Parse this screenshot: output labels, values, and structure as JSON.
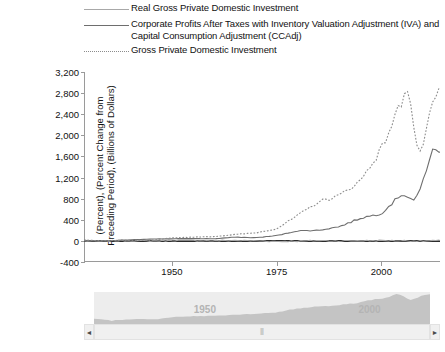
{
  "chart_data": {
    "type": "line",
    "title": "",
    "xlabel": "",
    "ylabel": "(Percent), (Percent Change from Preceding Period), (Billions of Dollars)",
    "ylabel_line1": "(Percent), (Percent Change from",
    "ylabel_line2": "Preceding Period), (Billions of Dollars)",
    "xlim": [
      1929,
      2014
    ],
    "ylim": [
      -400,
      3200
    ],
    "yticks": [
      -400,
      0,
      400,
      800,
      1200,
      1600,
      2000,
      2400,
      2800,
      3200
    ],
    "ytick_labels": [
      "-400",
      "0",
      "400",
      "800",
      "1,200",
      "1,600",
      "2,000",
      "2,400",
      "2,800",
      "3,200"
    ],
    "xticks": [
      1950,
      1975,
      2000
    ],
    "xtick_labels": [
      "1950",
      "1975",
      "2000"
    ],
    "grid": false,
    "legend_position": "top",
    "zero_line": true,
    "series": [
      {
        "name": "Real Gross Private Domestic Investment",
        "style": "solid",
        "color": "#a8a8a8",
        "x": [
          1929,
          1933,
          1937,
          1940,
          1945,
          1950,
          1955,
          1960,
          1965,
          1970,
          1975,
          1980,
          1985,
          1990,
          1995,
          2000,
          2005,
          2010,
          2014
        ],
        "values": [
          2,
          -8,
          5,
          4,
          -3,
          10,
          6,
          3,
          8,
          2,
          -10,
          -5,
          7,
          -2,
          5,
          6,
          4,
          -4,
          5
        ]
      },
      {
        "name": "Corporate Profits After Taxes with Inventory Valuation Adjustment (IVA) and Capital Consumption Adjustment (CCAdj)",
        "style": "solid",
        "color": "#6e6e6e",
        "x": [
          1929,
          1933,
          1940,
          1945,
          1950,
          1955,
          1960,
          1965,
          1970,
          1975,
          1980,
          1985,
          1990,
          1995,
          2000,
          2005,
          2008,
          2009,
          2012,
          2014
        ],
        "values": [
          10,
          -2,
          20,
          35,
          40,
          45,
          40,
          70,
          60,
          100,
          190,
          200,
          270,
          430,
          520,
          900,
          760,
          900,
          1700,
          1680
        ]
      },
      {
        "name": "Gross Private Domestic Investment",
        "style": "dotted",
        "color": "#8c8c8c",
        "x": [
          1929,
          1933,
          1940,
          1945,
          1950,
          1955,
          1960,
          1965,
          1970,
          1975,
          1980,
          1985,
          1990,
          1995,
          2000,
          2005,
          2006,
          2009,
          2012,
          2014
        ],
        "values": [
          17,
          2,
          14,
          11,
          56,
          72,
          82,
          120,
          152,
          230,
          480,
          740,
          860,
          1140,
          1740,
          2670,
          3050,
          1560,
          2480,
          2900
        ]
      }
    ]
  },
  "legend": {
    "items": [
      {
        "label": "Real Gross Private Domestic Investment",
        "style": "solid-light"
      },
      {
        "label": "Corporate Profits After Taxes with Inventory Valuation Adjustment (IVA) and Capital Consumption Adjustment (CCAdj)",
        "style": "solid-dark"
      },
      {
        "label": "Gross Private Domestic Investment",
        "style": "dotted"
      }
    ]
  },
  "range_selector": {
    "overview_labels": [
      "1950",
      "2000"
    ],
    "grip": "⦀",
    "left_arrow": "◄",
    "right_arrow": "►"
  }
}
